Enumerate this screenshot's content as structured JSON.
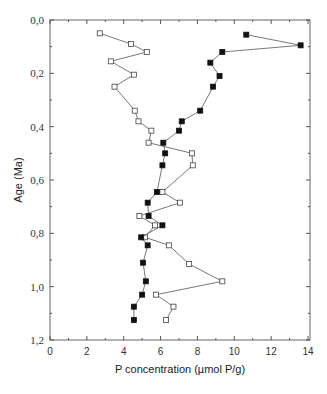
{
  "chart_data": {
    "type": "line",
    "title": "",
    "xlabel": "P concentration (µmol P/g)",
    "ylabel": "Age (Ma)",
    "xlim": [
      0,
      14
    ],
    "ylim": [
      1.2,
      0.0
    ],
    "y_inverted": true,
    "grid": false,
    "legend": null,
    "x_ticks": [
      "0",
      "2",
      "4",
      "6",
      "8",
      "10",
      "12",
      "14"
    ],
    "y_ticks": [
      "0,0",
      "0,2",
      "0,4",
      "0,6",
      "0,8",
      "1,0",
      "1,2"
    ],
    "series": [
      {
        "name": "open squares",
        "marker": "open-square",
        "points": [
          {
            "x": 2.7,
            "y": 0.05
          },
          {
            "x": 4.4,
            "y": 0.09
          },
          {
            "x": 5.25,
            "y": 0.12
          },
          {
            "x": 3.3,
            "y": 0.155
          },
          {
            "x": 4.55,
            "y": 0.205
          },
          {
            "x": 3.5,
            "y": 0.25
          },
          {
            "x": 4.6,
            "y": 0.34
          },
          {
            "x": 4.8,
            "y": 0.38
          },
          {
            "x": 5.5,
            "y": 0.415
          },
          {
            "x": 5.35,
            "y": 0.46
          },
          {
            "x": 7.7,
            "y": 0.5
          },
          {
            "x": 7.75,
            "y": 0.545
          },
          {
            "x": 6.1,
            "y": 0.645
          },
          {
            "x": 7.05,
            "y": 0.685
          },
          {
            "x": 4.85,
            "y": 0.735
          },
          {
            "x": 5.7,
            "y": 0.77
          },
          {
            "x": 5.15,
            "y": 0.815
          },
          {
            "x": 6.45,
            "y": 0.845
          },
          {
            "x": 7.55,
            "y": 0.915
          },
          {
            "x": 9.35,
            "y": 0.98
          },
          {
            "x": 5.75,
            "y": 1.03
          },
          {
            "x": 6.7,
            "y": 1.075
          },
          {
            "x": 6.3,
            "y": 1.125
          }
        ]
      },
      {
        "name": "filled squares",
        "marker": "filled-square",
        "points": [
          {
            "x": 10.65,
            "y": 0.055
          },
          {
            "x": 13.6,
            "y": 0.095
          },
          {
            "x": 9.35,
            "y": 0.12
          },
          {
            "x": 8.7,
            "y": 0.16
          },
          {
            "x": 9.2,
            "y": 0.21
          },
          {
            "x": 8.85,
            "y": 0.25
          },
          {
            "x": 8.15,
            "y": 0.34
          },
          {
            "x": 7.15,
            "y": 0.38
          },
          {
            "x": 7.0,
            "y": 0.415
          },
          {
            "x": 6.15,
            "y": 0.46
          },
          {
            "x": 6.25,
            "y": 0.5
          },
          {
            "x": 6.1,
            "y": 0.545
          },
          {
            "x": 5.8,
            "y": 0.645
          },
          {
            "x": 5.3,
            "y": 0.685
          },
          {
            "x": 5.35,
            "y": 0.735
          },
          {
            "x": 6.1,
            "y": 0.77
          },
          {
            "x": 4.95,
            "y": 0.815
          },
          {
            "x": 5.3,
            "y": 0.845
          },
          {
            "x": 5.05,
            "y": 0.91
          },
          {
            "x": 5.2,
            "y": 0.98
          },
          {
            "x": 5.0,
            "y": 1.03
          },
          {
            "x": 4.55,
            "y": 1.075
          },
          {
            "x": 4.55,
            "y": 1.125
          }
        ]
      }
    ]
  },
  "colors": {
    "axis": "#555555",
    "line": "#555555",
    "marker_fill": "#111111",
    "open_fill": "#ffffff"
  }
}
